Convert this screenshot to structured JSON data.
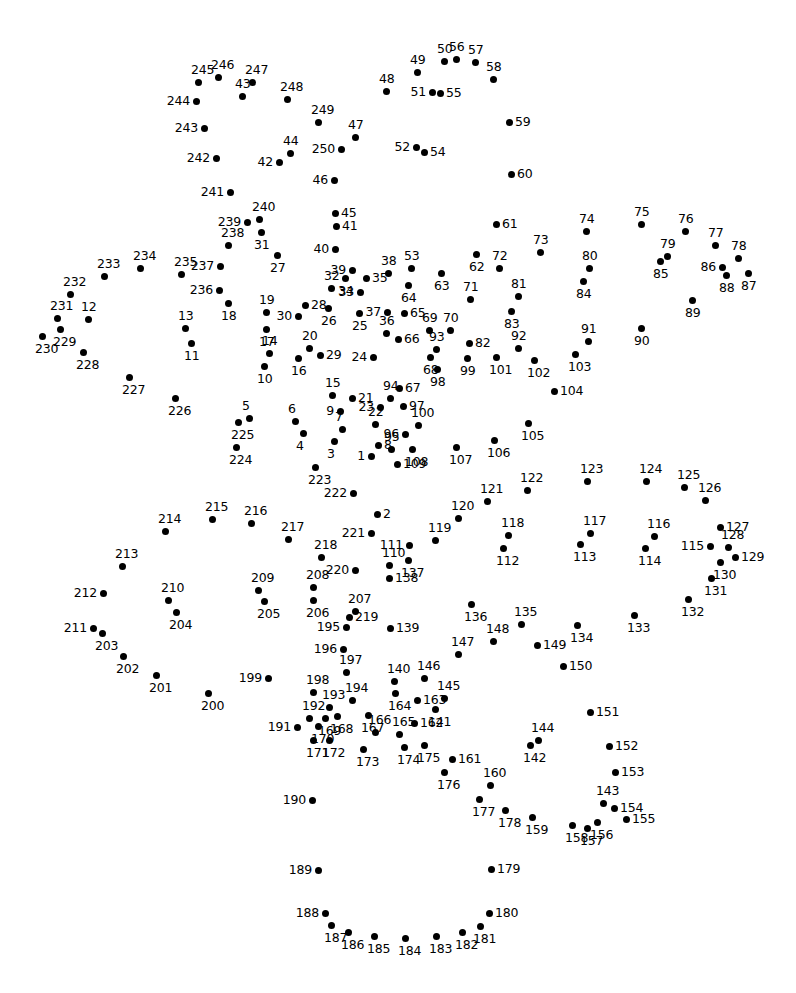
{
  "page": {
    "type": "connect-the-dots",
    "width": 796,
    "height": 993,
    "background_color": "#ffffff",
    "dot_color": "#000000",
    "label_color": "#000000",
    "total_dots": 250
  },
  "dots": [
    {
      "n": "1",
      "x": 371,
      "y": 456,
      "lp": "l"
    },
    {
      "n": "2",
      "x": 377,
      "y": 514,
      "lp": "r"
    },
    {
      "n": "3",
      "x": 334,
      "y": 441,
      "lp": "b"
    },
    {
      "n": "4",
      "x": 303,
      "y": 433,
      "lp": "b"
    },
    {
      "n": "5",
      "x": 249,
      "y": 418,
      "lp": "t"
    },
    {
      "n": "6",
      "x": 295,
      "y": 421,
      "lp": "t"
    },
    {
      "n": "7",
      "x": 342,
      "y": 429,
      "lp": "t"
    },
    {
      "n": "8",
      "x": 378,
      "y": 445,
      "lp": "r"
    },
    {
      "n": "9",
      "x": 340,
      "y": 411,
      "lp": "l"
    },
    {
      "n": "10",
      "x": 264,
      "y": 366,
      "lp": "b"
    },
    {
      "n": "11",
      "x": 191,
      "y": 343,
      "lp": "b"
    },
    {
      "n": "12",
      "x": 88,
      "y": 319,
      "lp": "t"
    },
    {
      "n": "13",
      "x": 185,
      "y": 328,
      "lp": "t"
    },
    {
      "n": "14",
      "x": 269,
      "y": 353,
      "lp": "t"
    },
    {
      "n": "15",
      "x": 332,
      "y": 395,
      "lp": "t"
    },
    {
      "n": "16",
      "x": 298,
      "y": 358,
      "lp": "b"
    },
    {
      "n": "17",
      "x": 266,
      "y": 329,
      "lp": "b"
    },
    {
      "n": "18",
      "x": 228,
      "y": 303,
      "lp": "b"
    },
    {
      "n": "19",
      "x": 266,
      "y": 312,
      "lp": "t"
    },
    {
      "n": "20",
      "x": 309,
      "y": 348,
      "lp": "t"
    },
    {
      "n": "21",
      "x": 352,
      "y": 398,
      "lp": "r"
    },
    {
      "n": "22",
      "x": 375,
      "y": 424,
      "lp": "t"
    },
    {
      "n": "23",
      "x": 380,
      "y": 407,
      "lp": "l"
    },
    {
      "n": "24",
      "x": 373,
      "y": 357,
      "lp": "l"
    },
    {
      "n": "25",
      "x": 359,
      "y": 313,
      "lp": "b"
    },
    {
      "n": "26",
      "x": 328,
      "y": 308,
      "lp": "b"
    },
    {
      "n": "27",
      "x": 277,
      "y": 255,
      "lp": "b"
    },
    {
      "n": "28",
      "x": 305,
      "y": 305,
      "lp": "r"
    },
    {
      "n": "29",
      "x": 320,
      "y": 355,
      "lp": "r"
    },
    {
      "n": "30",
      "x": 298,
      "y": 316,
      "lp": "l"
    },
    {
      "n": "31",
      "x": 261,
      "y": 232,
      "lp": "b"
    },
    {
      "n": "32",
      "x": 331,
      "y": 288,
      "lp": "t"
    },
    {
      "n": "33",
      "x": 360,
      "y": 292,
      "lp": "l"
    },
    {
      "n": "34",
      "x": 345,
      "y": 278,
      "lp": "b"
    },
    {
      "n": "35",
      "x": 366,
      "y": 278,
      "lp": "r"
    },
    {
      "n": "36",
      "x": 386,
      "y": 333,
      "lp": "t"
    },
    {
      "n": "37",
      "x": 387,
      "y": 312,
      "lp": "l"
    },
    {
      "n": "38",
      "x": 388,
      "y": 273,
      "lp": "t"
    },
    {
      "n": "39",
      "x": 352,
      "y": 270,
      "lp": "l"
    },
    {
      "n": "40",
      "x": 335,
      "y": 249,
      "lp": "l"
    },
    {
      "n": "41",
      "x": 336,
      "y": 226,
      "lp": "r"
    },
    {
      "n": "42",
      "x": 279,
      "y": 162,
      "lp": "l"
    },
    {
      "n": "43",
      "x": 242,
      "y": 96,
      "lp": "t"
    },
    {
      "n": "44",
      "x": 290,
      "y": 153,
      "lp": "t"
    },
    {
      "n": "45",
      "x": 335,
      "y": 213,
      "lp": "r"
    },
    {
      "n": "46",
      "x": 334,
      "y": 180,
      "lp": "l"
    },
    {
      "n": "47",
      "x": 355,
      "y": 137,
      "lp": "t"
    },
    {
      "n": "48",
      "x": 386,
      "y": 91,
      "lp": "t"
    },
    {
      "n": "49",
      "x": 417,
      "y": 72,
      "lp": "t"
    },
    {
      "n": "50",
      "x": 444,
      "y": 61,
      "lp": "t"
    },
    {
      "n": "51",
      "x": 432,
      "y": 92,
      "lp": "l"
    },
    {
      "n": "52",
      "x": 416,
      "y": 147,
      "lp": "l"
    },
    {
      "n": "53",
      "x": 411,
      "y": 268,
      "lp": "t"
    },
    {
      "n": "54",
      "x": 424,
      "y": 152,
      "lp": "r"
    },
    {
      "n": "55",
      "x": 440,
      "y": 93,
      "lp": "r"
    },
    {
      "n": "56",
      "x": 456,
      "y": 59,
      "lp": "t"
    },
    {
      "n": "57",
      "x": 475,
      "y": 62,
      "lp": "t"
    },
    {
      "n": "58",
      "x": 493,
      "y": 79,
      "lp": "t"
    },
    {
      "n": "59",
      "x": 509,
      "y": 122,
      "lp": "r"
    },
    {
      "n": "60",
      "x": 511,
      "y": 174,
      "lp": "r"
    },
    {
      "n": "61",
      "x": 496,
      "y": 224,
      "lp": "r"
    },
    {
      "n": "62",
      "x": 476,
      "y": 254,
      "lp": "b"
    },
    {
      "n": "63",
      "x": 441,
      "y": 273,
      "lp": "b"
    },
    {
      "n": "64",
      "x": 408,
      "y": 285,
      "lp": "b"
    },
    {
      "n": "65",
      "x": 404,
      "y": 313,
      "lp": "r"
    },
    {
      "n": "66",
      "x": 398,
      "y": 339,
      "lp": "r"
    },
    {
      "n": "67",
      "x": 399,
      "y": 388,
      "lp": "r"
    },
    {
      "n": "68",
      "x": 430,
      "y": 357,
      "lp": "b"
    },
    {
      "n": "69",
      "x": 429,
      "y": 330,
      "lp": "t"
    },
    {
      "n": "70",
      "x": 450,
      "y": 330,
      "lp": "t"
    },
    {
      "n": "71",
      "x": 470,
      "y": 299,
      "lp": "t"
    },
    {
      "n": "72",
      "x": 499,
      "y": 268,
      "lp": "t"
    },
    {
      "n": "73",
      "x": 540,
      "y": 252,
      "lp": "t"
    },
    {
      "n": "74",
      "x": 586,
      "y": 231,
      "lp": "t"
    },
    {
      "n": "75",
      "x": 641,
      "y": 224,
      "lp": "t"
    },
    {
      "n": "76",
      "x": 685,
      "y": 231,
      "lp": "t"
    },
    {
      "n": "77",
      "x": 715,
      "y": 245,
      "lp": "t"
    },
    {
      "n": "78",
      "x": 738,
      "y": 258,
      "lp": "t"
    },
    {
      "n": "79",
      "x": 667,
      "y": 256,
      "lp": "t"
    },
    {
      "n": "80",
      "x": 589,
      "y": 268,
      "lp": "t"
    },
    {
      "n": "81",
      "x": 518,
      "y": 296,
      "lp": "t"
    },
    {
      "n": "82",
      "x": 469,
      "y": 343,
      "lp": "r"
    },
    {
      "n": "83",
      "x": 511,
      "y": 311,
      "lp": "b"
    },
    {
      "n": "84",
      "x": 583,
      "y": 281,
      "lp": "b"
    },
    {
      "n": "85",
      "x": 660,
      "y": 261,
      "lp": "b"
    },
    {
      "n": "86",
      "x": 722,
      "y": 267,
      "lp": "l"
    },
    {
      "n": "87",
      "x": 748,
      "y": 273,
      "lp": "b"
    },
    {
      "n": "88",
      "x": 726,
      "y": 275,
      "lp": "b"
    },
    {
      "n": "89",
      "x": 692,
      "y": 300,
      "lp": "b"
    },
    {
      "n": "90",
      "x": 641,
      "y": 328,
      "lp": "b"
    },
    {
      "n": "91",
      "x": 588,
      "y": 341,
      "lp": "t"
    },
    {
      "n": "92",
      "x": 518,
      "y": 348,
      "lp": "t"
    },
    {
      "n": "93",
      "x": 436,
      "y": 349,
      "lp": "t"
    },
    {
      "n": "94",
      "x": 390,
      "y": 398,
      "lp": "t"
    },
    {
      "n": "95",
      "x": 391,
      "y": 449,
      "lp": "t"
    },
    {
      "n": "96",
      "x": 405,
      "y": 434,
      "lp": "l"
    },
    {
      "n": "97",
      "x": 403,
      "y": 406,
      "lp": "r"
    },
    {
      "n": "98",
      "x": 437,
      "y": 369,
      "lp": "b"
    },
    {
      "n": "99",
      "x": 467,
      "y": 358,
      "lp": "b"
    },
    {
      "n": "100",
      "x": 418,
      "y": 425,
      "lp": "t"
    },
    {
      "n": "101",
      "x": 496,
      "y": 357,
      "lp": "b"
    },
    {
      "n": "102",
      "x": 534,
      "y": 360,
      "lp": "b"
    },
    {
      "n": "103",
      "x": 575,
      "y": 354,
      "lp": "b"
    },
    {
      "n": "104",
      "x": 554,
      "y": 391,
      "lp": "r"
    },
    {
      "n": "105",
      "x": 528,
      "y": 423,
      "lp": "b"
    },
    {
      "n": "106",
      "x": 494,
      "y": 440,
      "lp": "b"
    },
    {
      "n": "107",
      "x": 456,
      "y": 447,
      "lp": "b"
    },
    {
      "n": "108",
      "x": 412,
      "y": 449,
      "lp": "b"
    },
    {
      "n": "109",
      "x": 397,
      "y": 464,
      "lp": "r"
    },
    {
      "n": "110",
      "x": 389,
      "y": 565,
      "lp": "t"
    },
    {
      "n": "111",
      "x": 409,
      "y": 545,
      "lp": "l"
    },
    {
      "n": "112",
      "x": 503,
      "y": 548,
      "lp": "b"
    },
    {
      "n": "113",
      "x": 580,
      "y": 544,
      "lp": "b"
    },
    {
      "n": "114",
      "x": 645,
      "y": 548,
      "lp": "b"
    },
    {
      "n": "115",
      "x": 710,
      "y": 546,
      "lp": "l"
    },
    {
      "n": "116",
      "x": 654,
      "y": 536,
      "lp": "t"
    },
    {
      "n": "117",
      "x": 590,
      "y": 533,
      "lp": "t"
    },
    {
      "n": "118",
      "x": 508,
      "y": 535,
      "lp": "t"
    },
    {
      "n": "119",
      "x": 435,
      "y": 540,
      "lp": "t"
    },
    {
      "n": "120",
      "x": 458,
      "y": 518,
      "lp": "t"
    },
    {
      "n": "121",
      "x": 487,
      "y": 501,
      "lp": "t"
    },
    {
      "n": "122",
      "x": 527,
      "y": 490,
      "lp": "t"
    },
    {
      "n": "123",
      "x": 587,
      "y": 481,
      "lp": "t"
    },
    {
      "n": "124",
      "x": 646,
      "y": 481,
      "lp": "t"
    },
    {
      "n": "125",
      "x": 684,
      "y": 487,
      "lp": "t"
    },
    {
      "n": "126",
      "x": 705,
      "y": 500,
      "lp": "t"
    },
    {
      "n": "127",
      "x": 720,
      "y": 527,
      "lp": "r"
    },
    {
      "n": "128",
      "x": 728,
      "y": 547,
      "lp": "t"
    },
    {
      "n": "129",
      "x": 735,
      "y": 557,
      "lp": "r"
    },
    {
      "n": "130",
      "x": 720,
      "y": 562,
      "lp": "b"
    },
    {
      "n": "131",
      "x": 711,
      "y": 578,
      "lp": "b"
    },
    {
      "n": "132",
      "x": 688,
      "y": 599,
      "lp": "b"
    },
    {
      "n": "133",
      "x": 634,
      "y": 615,
      "lp": "b"
    },
    {
      "n": "134",
      "x": 577,
      "y": 625,
      "lp": "b"
    },
    {
      "n": "135",
      "x": 521,
      "y": 624,
      "lp": "t"
    },
    {
      "n": "136",
      "x": 471,
      "y": 604,
      "lp": "b"
    },
    {
      "n": "137",
      "x": 408,
      "y": 560,
      "lp": "b"
    },
    {
      "n": "138",
      "x": 389,
      "y": 578,
      "lp": "r"
    },
    {
      "n": "139",
      "x": 390,
      "y": 628,
      "lp": "r"
    },
    {
      "n": "140",
      "x": 394,
      "y": 681,
      "lp": "t"
    },
    {
      "n": "141",
      "x": 435,
      "y": 709,
      "lp": "b"
    },
    {
      "n": "142",
      "x": 530,
      "y": 745,
      "lp": "b"
    },
    {
      "n": "143",
      "x": 603,
      "y": 803,
      "lp": "t"
    },
    {
      "n": "144",
      "x": 538,
      "y": 740,
      "lp": "t"
    },
    {
      "n": "145",
      "x": 444,
      "y": 698,
      "lp": "t"
    },
    {
      "n": "146",
      "x": 424,
      "y": 678,
      "lp": "t"
    },
    {
      "n": "147",
      "x": 458,
      "y": 654,
      "lp": "t"
    },
    {
      "n": "148",
      "x": 493,
      "y": 641,
      "lp": "t"
    },
    {
      "n": "149",
      "x": 537,
      "y": 645,
      "lp": "r"
    },
    {
      "n": "150",
      "x": 563,
      "y": 666,
      "lp": "r"
    },
    {
      "n": "151",
      "x": 590,
      "y": 712,
      "lp": "r"
    },
    {
      "n": "152",
      "x": 609,
      "y": 746,
      "lp": "r"
    },
    {
      "n": "153",
      "x": 615,
      "y": 772,
      "lp": "r"
    },
    {
      "n": "154",
      "x": 614,
      "y": 808,
      "lp": "r"
    },
    {
      "n": "155",
      "x": 626,
      "y": 819,
      "lp": "r"
    },
    {
      "n": "156",
      "x": 597,
      "y": 822,
      "lp": "b"
    },
    {
      "n": "157",
      "x": 587,
      "y": 828,
      "lp": "b"
    },
    {
      "n": "158",
      "x": 572,
      "y": 825,
      "lp": "b"
    },
    {
      "n": "159",
      "x": 532,
      "y": 817,
      "lp": "b"
    },
    {
      "n": "160",
      "x": 490,
      "y": 785,
      "lp": "t"
    },
    {
      "n": "161",
      "x": 452,
      "y": 759,
      "lp": "r"
    },
    {
      "n": "162",
      "x": 414,
      "y": 723,
      "lp": "r"
    },
    {
      "n": "163",
      "x": 417,
      "y": 700,
      "lp": "r"
    },
    {
      "n": "164",
      "x": 395,
      "y": 693,
      "lp": "b"
    },
    {
      "n": "165",
      "x": 399,
      "y": 734,
      "lp": "t"
    },
    {
      "n": "166",
      "x": 375,
      "y": 732,
      "lp": "t"
    },
    {
      "n": "167",
      "x": 368,
      "y": 715,
      "lp": "b"
    },
    {
      "n": "168",
      "x": 337,
      "y": 716,
      "lp": "b"
    },
    {
      "n": "169",
      "x": 325,
      "y": 718,
      "lp": "b"
    },
    {
      "n": "170",
      "x": 318,
      "y": 726,
      "lp": "b"
    },
    {
      "n": "171",
      "x": 313,
      "y": 740,
      "lp": "b"
    },
    {
      "n": "172",
      "x": 329,
      "y": 740,
      "lp": "b"
    },
    {
      "n": "173",
      "x": 363,
      "y": 749,
      "lp": "b"
    },
    {
      "n": "174",
      "x": 404,
      "y": 747,
      "lp": "b"
    },
    {
      "n": "175",
      "x": 424,
      "y": 745,
      "lp": "b"
    },
    {
      "n": "176",
      "x": 444,
      "y": 772,
      "lp": "b"
    },
    {
      "n": "177",
      "x": 479,
      "y": 799,
      "lp": "b"
    },
    {
      "n": "178",
      "x": 505,
      "y": 810,
      "lp": "b"
    },
    {
      "n": "179",
      "x": 491,
      "y": 869,
      "lp": "r"
    },
    {
      "n": "180",
      "x": 489,
      "y": 913,
      "lp": "r"
    },
    {
      "n": "181",
      "x": 480,
      "y": 926,
      "lp": "b"
    },
    {
      "n": "182",
      "x": 462,
      "y": 932,
      "lp": "b"
    },
    {
      "n": "183",
      "x": 436,
      "y": 936,
      "lp": "b"
    },
    {
      "n": "184",
      "x": 405,
      "y": 938,
      "lp": "b"
    },
    {
      "n": "185",
      "x": 374,
      "y": 936,
      "lp": "b"
    },
    {
      "n": "186",
      "x": 348,
      "y": 932,
      "lp": "b"
    },
    {
      "n": "187",
      "x": 331,
      "y": 925,
      "lp": "b"
    },
    {
      "n": "188",
      "x": 325,
      "y": 913,
      "lp": "l"
    },
    {
      "n": "189",
      "x": 318,
      "y": 870,
      "lp": "l"
    },
    {
      "n": "190",
      "x": 312,
      "y": 800,
      "lp": "l"
    },
    {
      "n": "191",
      "x": 297,
      "y": 727,
      "lp": "l"
    },
    {
      "n": "192",
      "x": 309,
      "y": 718,
      "lp": "t"
    },
    {
      "n": "193",
      "x": 329,
      "y": 707,
      "lp": "t"
    },
    {
      "n": "194",
      "x": 352,
      "y": 700,
      "lp": "t"
    },
    {
      "n": "195",
      "x": 346,
      "y": 627,
      "lp": "l"
    },
    {
      "n": "196",
      "x": 343,
      "y": 649,
      "lp": "l"
    },
    {
      "n": "197",
      "x": 346,
      "y": 672,
      "lp": "t"
    },
    {
      "n": "198",
      "x": 313,
      "y": 692,
      "lp": "t"
    },
    {
      "n": "199",
      "x": 268,
      "y": 678,
      "lp": "l"
    },
    {
      "n": "200",
      "x": 208,
      "y": 693,
      "lp": "b"
    },
    {
      "n": "201",
      "x": 156,
      "y": 675,
      "lp": "b"
    },
    {
      "n": "202",
      "x": 123,
      "y": 656,
      "lp": "b"
    },
    {
      "n": "203",
      "x": 102,
      "y": 633,
      "lp": "b"
    },
    {
      "n": "204",
      "x": 176,
      "y": 612,
      "lp": "b"
    },
    {
      "n": "205",
      "x": 264,
      "y": 601,
      "lp": "b"
    },
    {
      "n": "206",
      "x": 313,
      "y": 600,
      "lp": "b"
    },
    {
      "n": "207",
      "x": 355,
      "y": 611,
      "lp": "t"
    },
    {
      "n": "208",
      "x": 313,
      "y": 587,
      "lp": "t"
    },
    {
      "n": "209",
      "x": 258,
      "y": 590,
      "lp": "t"
    },
    {
      "n": "210",
      "x": 168,
      "y": 600,
      "lp": "t"
    },
    {
      "n": "211",
      "x": 93,
      "y": 628,
      "lp": "l"
    },
    {
      "n": "212",
      "x": 103,
      "y": 593,
      "lp": "l"
    },
    {
      "n": "213",
      "x": 122,
      "y": 566,
      "lp": "t"
    },
    {
      "n": "214",
      "x": 165,
      "y": 531,
      "lp": "t"
    },
    {
      "n": "215",
      "x": 212,
      "y": 519,
      "lp": "t"
    },
    {
      "n": "216",
      "x": 251,
      "y": 523,
      "lp": "t"
    },
    {
      "n": "217",
      "x": 288,
      "y": 539,
      "lp": "t"
    },
    {
      "n": "218",
      "x": 321,
      "y": 557,
      "lp": "t"
    },
    {
      "n": "219",
      "x": 349,
      "y": 617,
      "lp": "r"
    },
    {
      "n": "220",
      "x": 355,
      "y": 570,
      "lp": "l"
    },
    {
      "n": "221",
      "x": 371,
      "y": 533,
      "lp": "l"
    },
    {
      "n": "222",
      "x": 353,
      "y": 493,
      "lp": "l"
    },
    {
      "n": "223",
      "x": 315,
      "y": 467,
      "lp": "b"
    },
    {
      "n": "224",
      "x": 236,
      "y": 447,
      "lp": "b"
    },
    {
      "n": "225",
      "x": 238,
      "y": 422,
      "lp": "b"
    },
    {
      "n": "226",
      "x": 175,
      "y": 398,
      "lp": "b"
    },
    {
      "n": "227",
      "x": 129,
      "y": 377,
      "lp": "b"
    },
    {
      "n": "228",
      "x": 83,
      "y": 352,
      "lp": "b"
    },
    {
      "n": "229",
      "x": 60,
      "y": 329,
      "lp": "b"
    },
    {
      "n": "230",
      "x": 42,
      "y": 336,
      "lp": "b"
    },
    {
      "n": "231",
      "x": 57,
      "y": 318,
      "lp": "t"
    },
    {
      "n": "232",
      "x": 70,
      "y": 294,
      "lp": "t"
    },
    {
      "n": "233",
      "x": 104,
      "y": 276,
      "lp": "t"
    },
    {
      "n": "234",
      "x": 140,
      "y": 268,
      "lp": "t"
    },
    {
      "n": "235",
      "x": 181,
      "y": 274,
      "lp": "t"
    },
    {
      "n": "236",
      "x": 219,
      "y": 290,
      "lp": "l"
    },
    {
      "n": "237",
      "x": 220,
      "y": 266,
      "lp": "l"
    },
    {
      "n": "238",
      "x": 228,
      "y": 245,
      "lp": "t"
    },
    {
      "n": "239",
      "x": 247,
      "y": 222,
      "lp": "l"
    },
    {
      "n": "240",
      "x": 259,
      "y": 219,
      "lp": "t"
    },
    {
      "n": "241",
      "x": 230,
      "y": 192,
      "lp": "l"
    },
    {
      "n": "242",
      "x": 216,
      "y": 158,
      "lp": "l"
    },
    {
      "n": "243",
      "x": 204,
      "y": 128,
      "lp": "l"
    },
    {
      "n": "244",
      "x": 196,
      "y": 101,
      "lp": "l"
    },
    {
      "n": "245",
      "x": 198,
      "y": 82,
      "lp": "t"
    },
    {
      "n": "246",
      "x": 218,
      "y": 77,
      "lp": "t"
    },
    {
      "n": "247",
      "x": 252,
      "y": 82,
      "lp": "t"
    },
    {
      "n": "248",
      "x": 287,
      "y": 99,
      "lp": "t"
    },
    {
      "n": "249",
      "x": 318,
      "y": 122,
      "lp": "t"
    },
    {
      "n": "250",
      "x": 341,
      "y": 149,
      "lp": "l"
    }
  ]
}
